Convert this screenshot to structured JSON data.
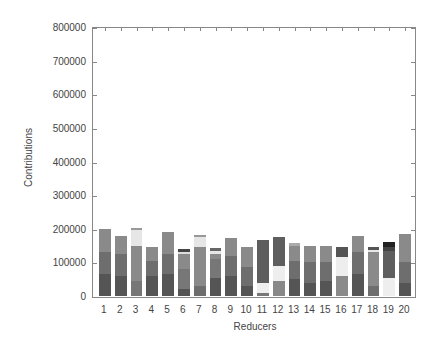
{
  "chart_data": {
    "type": "bar",
    "stacked": true,
    "title": "",
    "xlabel": "Reducers",
    "ylabel": "Contributions",
    "ylim": [
      0,
      800000
    ],
    "yticks": [
      0,
      100000,
      200000,
      300000,
      400000,
      500000,
      600000,
      700000,
      800000
    ],
    "ytick_labels": [
      "0",
      "100000",
      "200000",
      "300000",
      "400000",
      "500000",
      "600000",
      "700000",
      "800000"
    ],
    "categories": [
      "1",
      "2",
      "3",
      "4",
      "5",
      "6",
      "7",
      "8",
      "9",
      "10",
      "11",
      "12",
      "13",
      "14",
      "15",
      "16",
      "17",
      "18",
      "19",
      "20"
    ],
    "totals": [
      200000,
      180000,
      202000,
      147000,
      190000,
      140000,
      183000,
      142000,
      172000,
      145000,
      167000,
      176000,
      158000,
      150000,
      150000,
      147000,
      178000,
      145000,
      160000,
      183000
    ],
    "segments": [
      [
        {
          "v": 65000,
          "c": "#555555"
        },
        {
          "v": 65000,
          "c": "#6e6e6e"
        },
        {
          "v": 70000,
          "c": "#8a8a8a"
        }
      ],
      [
        {
          "v": 60000,
          "c": "#555555"
        },
        {
          "v": 65000,
          "c": "#6e6e6e"
        },
        {
          "v": 55000,
          "c": "#8a8a8a"
        }
      ],
      [
        {
          "v": 45000,
          "c": "#777777"
        },
        {
          "v": 105000,
          "c": "#8a8a8a"
        },
        {
          "v": 47000,
          "c": "#e6e6e6"
        },
        {
          "v": 5000,
          "c": "#999999"
        }
      ],
      [
        {
          "v": 60000,
          "c": "#555555"
        },
        {
          "v": 45000,
          "c": "#6e6e6e"
        },
        {
          "v": 42000,
          "c": "#8a8a8a"
        }
      ],
      [
        {
          "v": 65000,
          "c": "#555555"
        },
        {
          "v": 60000,
          "c": "#6e6e6e"
        },
        {
          "v": 65000,
          "c": "#8a8a8a"
        }
      ],
      [
        {
          "v": 20000,
          "c": "#555555"
        },
        {
          "v": 60000,
          "c": "#777777"
        },
        {
          "v": 45000,
          "c": "#8a8a8a"
        },
        {
          "v": 5000,
          "c": "#dddddd"
        },
        {
          "v": 10000,
          "c": "#444444"
        }
      ],
      [
        {
          "v": 30000,
          "c": "#6e6e6e"
        },
        {
          "v": 115000,
          "c": "#8a8a8a"
        },
        {
          "v": 30000,
          "c": "#e6e6e6"
        },
        {
          "v": 8000,
          "c": "#999999"
        }
      ],
      [
        {
          "v": 55000,
          "c": "#555555"
        },
        {
          "v": 55000,
          "c": "#777777"
        },
        {
          "v": 15000,
          "c": "#8a8a8a"
        },
        {
          "v": 8000,
          "c": "#e6e6e6"
        },
        {
          "v": 9000,
          "c": "#666666"
        }
      ],
      [
        {
          "v": 60000,
          "c": "#555555"
        },
        {
          "v": 60000,
          "c": "#6e6e6e"
        },
        {
          "v": 52000,
          "c": "#8a8a8a"
        }
      ],
      [
        {
          "v": 30000,
          "c": "#555555"
        },
        {
          "v": 55000,
          "c": "#6e6e6e"
        },
        {
          "v": 60000,
          "c": "#8a8a8a"
        }
      ],
      [
        {
          "v": 8000,
          "c": "#777777"
        },
        {
          "v": 30000,
          "c": "#eeeeee"
        },
        {
          "v": 129000,
          "c": "#5e5e5e"
        }
      ],
      [
        {
          "v": 45000,
          "c": "#888888"
        },
        {
          "v": 45000,
          "c": "#eeeeee"
        },
        {
          "v": 86000,
          "c": "#5e5e5e"
        }
      ],
      [
        {
          "v": 50000,
          "c": "#555555"
        },
        {
          "v": 55000,
          "c": "#6e6e6e"
        },
        {
          "v": 45000,
          "c": "#8a8a8a"
        },
        {
          "v": 8000,
          "c": "#aaaaaa"
        }
      ],
      [
        {
          "v": 40000,
          "c": "#555555"
        },
        {
          "v": 60000,
          "c": "#6e6e6e"
        },
        {
          "v": 50000,
          "c": "#8a8a8a"
        }
      ],
      [
        {
          "v": 45000,
          "c": "#555555"
        },
        {
          "v": 55000,
          "c": "#6e6e6e"
        },
        {
          "v": 50000,
          "c": "#8a8a8a"
        }
      ],
      [
        {
          "v": 60000,
          "c": "#8a8a8a"
        },
        {
          "v": 55000,
          "c": "#eeeeee"
        },
        {
          "v": 32000,
          "c": "#555555"
        }
      ],
      [
        {
          "v": 65000,
          "c": "#555555"
        },
        {
          "v": 65000,
          "c": "#6e6e6e"
        },
        {
          "v": 48000,
          "c": "#8a8a8a"
        }
      ],
      [
        {
          "v": 30000,
          "c": "#6e6e6e"
        },
        {
          "v": 100000,
          "c": "#8a8a8a"
        },
        {
          "v": 8000,
          "c": "#e6e6e6"
        },
        {
          "v": 7000,
          "c": "#555555"
        }
      ],
      [
        {
          "v": 55000,
          "c": "#eeeeee"
        },
        {
          "v": 80000,
          "c": "#5e5e5e"
        },
        {
          "v": 10000,
          "c": "#444444"
        },
        {
          "v": 15000,
          "c": "#222222"
        }
      ],
      [
        {
          "v": 40000,
          "c": "#555555"
        },
        {
          "v": 60000,
          "c": "#6e6e6e"
        },
        {
          "v": 83000,
          "c": "#8a8a8a"
        }
      ]
    ],
    "grid": false,
    "legend": false
  }
}
